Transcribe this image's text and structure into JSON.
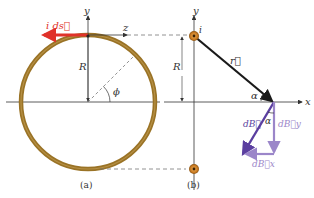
{
  "figure": {
    "panel_a": {
      "caption": "(a)",
      "axis_y": "y",
      "axis_z": "z",
      "current_label": "i ds⃗",
      "radius_label": "R",
      "angle_label": "ϕ"
    },
    "panel_b": {
      "caption": "(b)",
      "axis_y": "y",
      "axis_x": "x",
      "current_label": "i",
      "radius_label": "R",
      "r_vector_label": "r⃗",
      "alpha_label_1": "α",
      "alpha_label_2": "α",
      "dB_label": "dB⃗",
      "dBy_label": "dB⃗y",
      "dBx_label": "dB⃗x"
    },
    "colors": {
      "ring": "#9a7326",
      "current_arrow": "#e0322a",
      "axis": "#333333",
      "r_vector": "#1a1a1a",
      "dB": "#5b3fa0",
      "components": "#9b86c9",
      "dashed": "#777777"
    }
  }
}
